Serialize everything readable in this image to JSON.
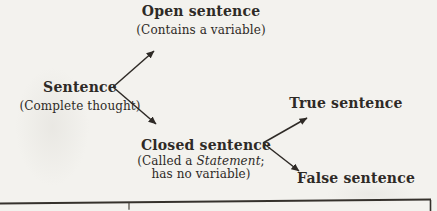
{
  "diagram": {
    "title_implicit": "Sentence classification tree",
    "root": {
      "label": "Sentence",
      "note": "(Complete thought)"
    },
    "open": {
      "label": "Open sentence",
      "note": "(Contains a variable)"
    },
    "closed": {
      "label": "Closed sentence",
      "note1_pre": "(Called a ",
      "note1_italic": "Statement",
      "note1_post": ";",
      "note2": "has no variable)"
    },
    "true_node": {
      "label": "True sentence"
    },
    "false_node": {
      "label": "False sentence"
    },
    "edges": [
      "sentence-to-open-sentence",
      "sentence-to-closed-sentence",
      "closed-sentence-to-true-sentence",
      "closed-sentence-to-false-sentence"
    ]
  },
  "table_fragment": {
    "description": "top border of table cropped at bottom edge"
  },
  "colors": {
    "ink": "#2e2a26",
    "paper": "#f3f2ee"
  }
}
